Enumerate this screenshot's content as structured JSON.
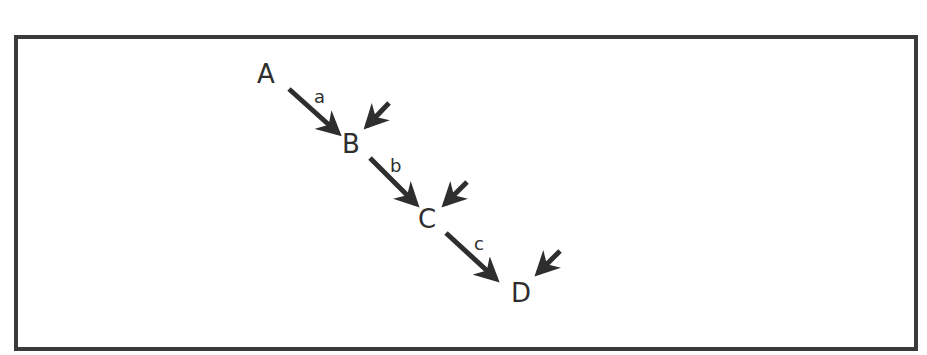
{
  "diagram": {
    "type": "reaction-sequence",
    "nodes": [
      {
        "id": "A",
        "label": "A"
      },
      {
        "id": "B",
        "label": "B"
      },
      {
        "id": "C",
        "label": "C"
      },
      {
        "id": "D",
        "label": "D"
      }
    ],
    "edges": [
      {
        "from": "A",
        "to": "B",
        "label": "a"
      },
      {
        "from": "B",
        "to": "C",
        "label": "b"
      },
      {
        "from": "C",
        "to": "D",
        "label": "c"
      }
    ],
    "incoming_arrows": [
      "B",
      "C",
      "D"
    ],
    "colors": {
      "stroke": "#2e2e2e",
      "frame": "#3a3a3a",
      "background": "#ffffff"
    }
  }
}
